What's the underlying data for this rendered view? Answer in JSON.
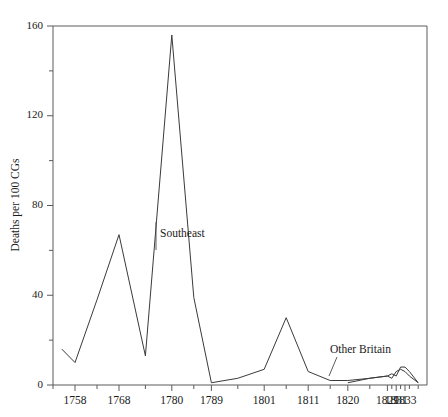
{
  "chart_data": {
    "type": "line",
    "title": "",
    "subtitle": "",
    "xlabel": "",
    "ylabel": "Deaths per 100 CGs",
    "xlim": [
      1753,
      1838
    ],
    "ylim": [
      0,
      160
    ],
    "grid": false,
    "legend_position": "inline-annotations",
    "y_ticks_major": [
      0,
      40,
      80,
      120,
      160
    ],
    "y_ticks_minor": [
      20,
      60,
      100,
      140
    ],
    "y_tick_labels": [
      "0",
      "40",
      "80",
      "120",
      "160"
    ],
    "x_tick_labels": [
      "1758",
      "1768",
      "1780",
      "1789",
      "1801",
      "1811",
      "1820",
      "1829",
      "1831",
      "1833"
    ],
    "x_tick_values": [
      1758,
      1768,
      1780,
      1789,
      1801,
      1811,
      1820,
      1829,
      1831,
      1833
    ],
    "x_minor_tick_values": [
      1753,
      1763,
      1774,
      1785,
      1795,
      1806,
      1816,
      1825,
      1830,
      1832,
      1834,
      1836
    ],
    "series": [
      {
        "name": "Southeast",
        "color": "#3a3a3a",
        "x": [
          1755,
          1758,
          1763,
          1768,
          1774,
          1780,
          1785,
          1789,
          1795,
          1801,
          1806,
          1811,
          1816,
          1820,
          1825,
          1829,
          1830,
          1831,
          1832,
          1833,
          1834,
          1836
        ],
        "values": [
          16,
          10,
          38,
          67,
          13,
          156,
          39,
          1,
          3,
          7,
          30,
          6,
          2,
          2,
          3,
          4,
          3,
          6,
          7,
          6,
          4,
          1
        ]
      },
      {
        "name": "Other Britain",
        "color": "#3a3a3a",
        "x": [
          1820,
          1825,
          1829,
          1830,
          1831,
          1832,
          1833,
          1834,
          1836
        ],
        "values": [
          1,
          3,
          4,
          5,
          4,
          8,
          8,
          6,
          1
        ]
      }
    ],
    "annotations": [
      {
        "label": "Southeast",
        "x": 1782,
        "y": 68
      },
      {
        "label": "Other Britain",
        "x": 1827,
        "y": 16
      }
    ]
  }
}
